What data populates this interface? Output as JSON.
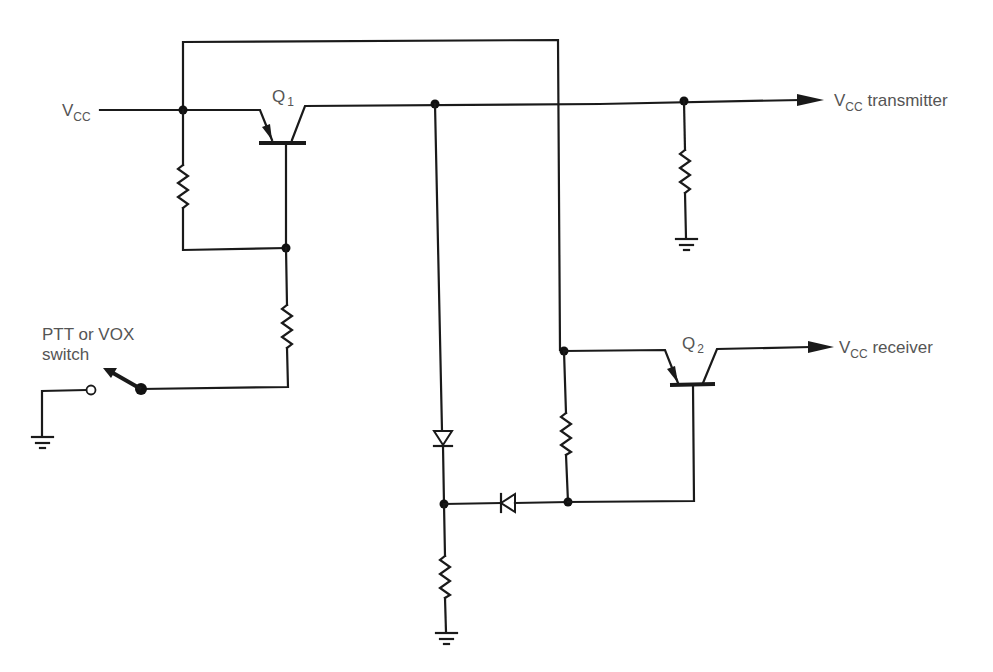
{
  "diagram": {
    "type": "circuit-schematic",
    "labels": {
      "vcc_in_main": "V",
      "vcc_in_sub": "CC",
      "q1_main": "Q",
      "q1_sub": "1",
      "q2_main": "Q",
      "q2_sub": "2",
      "vcc_tx_main": "V",
      "vcc_tx_sub": "CC",
      "vcc_tx_suffix": " transmitter",
      "vcc_rx_main": "V",
      "vcc_rx_sub": "CC",
      "vcc_rx_suffix": " receiver",
      "switch_line1": "PTT or VOX",
      "switch_line2": "switch"
    },
    "components": [
      {
        "id": "Q1",
        "kind": "pnp-transistor"
      },
      {
        "id": "Q2",
        "kind": "pnp-transistor"
      },
      {
        "id": "R1",
        "kind": "resistor",
        "location": "Q1 emitter to base bias"
      },
      {
        "id": "R2",
        "kind": "resistor",
        "location": "Q1 base to switch"
      },
      {
        "id": "R3",
        "kind": "resistor",
        "location": "transmitter load to ground"
      },
      {
        "id": "R4",
        "kind": "resistor",
        "location": "Q2 emitter to base bias"
      },
      {
        "id": "R5",
        "kind": "resistor",
        "location": "diode junction to ground"
      },
      {
        "id": "D1",
        "kind": "diode",
        "location": "Q1 collector down to junction"
      },
      {
        "id": "D2",
        "kind": "diode",
        "location": "Q2 base to junction"
      },
      {
        "id": "SW1",
        "kind": "switch",
        "label": "PTT or VOX switch"
      }
    ],
    "colors": {
      "wire": "#1a1a1a",
      "text": "#555555",
      "background": "#ffffff"
    }
  }
}
